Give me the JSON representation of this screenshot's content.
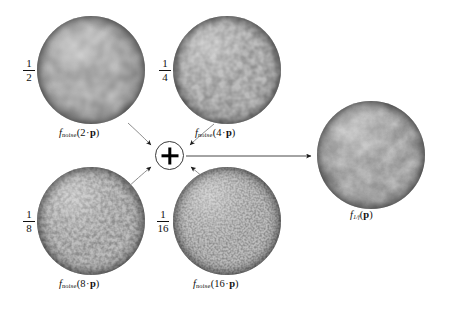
{
  "figure": {
    "background_color": "#ffffff",
    "ink_color": "#111111",
    "operator": {
      "symbol": "+",
      "name": "plus-operator"
    },
    "inputs": [
      {
        "id": "octave-1",
        "weight_numerator": "1",
        "weight_denominator": "2",
        "weight_value": 0.5,
        "frequency": "2",
        "function_name": "f",
        "function_subscript": "noise",
        "argument_scale": "2",
        "argument_symbol": "p",
        "caption_plain": "f_noise(2 · p)",
        "noise_scale_px": 13,
        "position": {
          "cx": 91,
          "cy": 70,
          "r": 54
        }
      },
      {
        "id": "octave-2",
        "weight_numerator": "1",
        "weight_denominator": "4",
        "weight_value": 0.25,
        "frequency": "4",
        "function_name": "f",
        "function_subscript": "noise",
        "argument_scale": "4",
        "argument_symbol": "p",
        "caption_plain": "f_noise(4 · p)",
        "noise_scale_px": 6.5,
        "position": {
          "cx": 227,
          "cy": 70,
          "r": 54
        }
      },
      {
        "id": "octave-3",
        "weight_numerator": "1",
        "weight_denominator": "8",
        "weight_value": 0.125,
        "frequency": "8",
        "function_name": "f",
        "function_subscript": "noise",
        "argument_scale": "8",
        "argument_symbol": "p",
        "caption_plain": "f_noise(8 · p)",
        "noise_scale_px": 3.2,
        "position": {
          "cx": 91,
          "cy": 221,
          "r": 54
        }
      },
      {
        "id": "octave-4",
        "weight_numerator": "1",
        "weight_denominator": "16",
        "weight_value": 0.0625,
        "frequency": "16",
        "function_name": "f",
        "function_subscript": "noise",
        "argument_scale": "16",
        "argument_symbol": "p",
        "caption_plain": "f_noise(16 · p)",
        "noise_scale_px": 1.7,
        "position": {
          "cx": 227,
          "cy": 221,
          "r": 54
        }
      }
    ],
    "output": {
      "id": "sum-result",
      "function_name": "f",
      "function_subscript": "1/f",
      "argument_symbol": "p",
      "caption_plain": "f_1/f(p)",
      "position": {
        "cx": 371,
        "cy": 155,
        "r": 54
      }
    }
  }
}
